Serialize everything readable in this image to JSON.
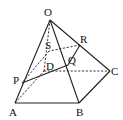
{
  "figure": {
    "type": "pyramid-section",
    "points": {
      "O": "O",
      "A": "A",
      "B": "B",
      "C": "C",
      "D": "D",
      "P": "P",
      "Q": "Q",
      "R": "R",
      "S": "S"
    },
    "solid_edges": [
      "OA",
      "OB",
      "OC",
      "AB",
      "BC",
      "PQ",
      "QR"
    ],
    "hidden_edges": [
      "OD",
      "AD",
      "DC",
      "RS",
      "SP"
    ]
  }
}
